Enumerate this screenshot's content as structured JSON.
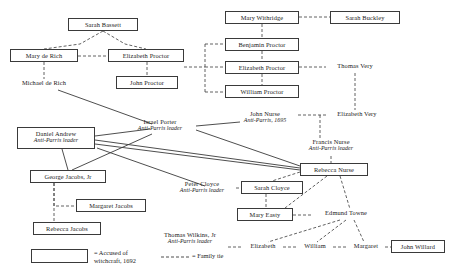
{
  "diagram": {
    "colors": {
      "line": "#3a3a3a",
      "box_border": "#3a3a3a",
      "text": "#1a1a1a",
      "background": "#ffffff"
    },
    "legend": {
      "accused_label": "= Accused of\nwitchcraft, 1692",
      "family_tie_label": "= Family tie"
    },
    "nodes": [
      {
        "id": "sarah-bassett",
        "name": "Sarah Bassett",
        "sub": "",
        "boxed": true,
        "x": 68,
        "y": 18,
        "w": 70,
        "h": 13
      },
      {
        "id": "mary-de-rich",
        "name": "Mary de Rich",
        "sub": "",
        "boxed": true,
        "x": 10,
        "y": 49,
        "w": 68,
        "h": 13
      },
      {
        "id": "elizabeth-proctor-l",
        "name": "Elizabeth Proctor",
        "sub": "",
        "boxed": true,
        "x": 108,
        "y": 49,
        "w": 76,
        "h": 13
      },
      {
        "id": "michael-de-rich",
        "name": "Michael de Rich",
        "sub": "",
        "boxed": false,
        "x": 10,
        "y": 79,
        "w": 68,
        "h": 11
      },
      {
        "id": "john-proctor",
        "name": "John Proctor",
        "sub": "",
        "boxed": true,
        "x": 116,
        "y": 76,
        "w": 62,
        "h": 13
      },
      {
        "id": "mary-withridge",
        "name": "Mary Withridge",
        "sub": "",
        "boxed": true,
        "x": 225,
        "y": 11,
        "w": 74,
        "h": 13
      },
      {
        "id": "sarah-buckley",
        "name": "Sarah Buckley",
        "sub": "",
        "boxed": true,
        "x": 330,
        "y": 11,
        "w": 70,
        "h": 13
      },
      {
        "id": "benjamin-proctor",
        "name": "Benjamin Proctor",
        "sub": "",
        "boxed": true,
        "x": 225,
        "y": 38,
        "w": 74,
        "h": 13
      },
      {
        "id": "elizabeth-proctor-r",
        "name": "Elizabeth Proctor",
        "sub": "",
        "boxed": true,
        "x": 225,
        "y": 61,
        "w": 74,
        "h": 13
      },
      {
        "id": "william-proctor",
        "name": "William Proctor",
        "sub": "",
        "boxed": true,
        "x": 225,
        "y": 85,
        "w": 74,
        "h": 13
      },
      {
        "id": "thomas-very",
        "name": "Thomas Very",
        "sub": "",
        "boxed": false,
        "x": 326,
        "y": 62,
        "w": 58,
        "h": 11
      },
      {
        "id": "john-nurse",
        "name": "John Nurse",
        "sub": "Anti-Parris, 1695",
        "boxed": false,
        "x": 232,
        "y": 110,
        "w": 66,
        "h": 18
      },
      {
        "id": "elizabeth-very",
        "name": "Elizabeth Very",
        "sub": "",
        "boxed": false,
        "x": 326,
        "y": 110,
        "w": 62,
        "h": 11
      },
      {
        "id": "israel-porter",
        "name": "Israel Porter",
        "sub": "Anti-Parris leader",
        "boxed": false,
        "x": 124,
        "y": 118,
        "w": 72,
        "h": 18
      },
      {
        "id": "daniel-andrew",
        "name": "Daniel Andrew",
        "sub": "Anti-Parris leader",
        "boxed": true,
        "x": 17,
        "y": 127,
        "w": 78,
        "h": 22
      },
      {
        "id": "francis-nurse",
        "name": "Francis Nurse",
        "sub": "Anti-Parris leader",
        "boxed": false,
        "x": 295,
        "y": 138,
        "w": 72,
        "h": 18
      },
      {
        "id": "rebecca-nurse",
        "name": "Rebecca Nurse",
        "sub": "",
        "boxed": true,
        "x": 300,
        "y": 163,
        "w": 68,
        "h": 13
      },
      {
        "id": "george-jacobs-jr",
        "name": "George Jacobs, Jr",
        "sub": "",
        "boxed": true,
        "x": 30,
        "y": 170,
        "w": 76,
        "h": 13
      },
      {
        "id": "peter-cloyce",
        "name": "Peter Cloyce",
        "sub": "Anti-Parris leader",
        "boxed": false,
        "x": 168,
        "y": 180,
        "w": 68,
        "h": 18
      },
      {
        "id": "sarah-cloyce",
        "name": "Sarah Cloyce",
        "sub": "",
        "boxed": true,
        "x": 241,
        "y": 181,
        "w": 62,
        "h": 13
      },
      {
        "id": "margaret-jacobs",
        "name": "Margaret Jacobs",
        "sub": "",
        "boxed": true,
        "x": 76,
        "y": 199,
        "w": 70,
        "h": 13
      },
      {
        "id": "mary-easty",
        "name": "Mary Easty",
        "sub": "",
        "boxed": true,
        "x": 237,
        "y": 208,
        "w": 56,
        "h": 13
      },
      {
        "id": "edmund-towne",
        "name": "Edmund Towne",
        "sub": "",
        "boxed": false,
        "x": 313,
        "y": 209,
        "w": 66,
        "h": 11
      },
      {
        "id": "rebecca-jacobs",
        "name": "Rebecca Jacobs",
        "sub": "",
        "boxed": true,
        "x": 33,
        "y": 222,
        "w": 68,
        "h": 13
      },
      {
        "id": "thomas-wilkins-jr",
        "name": "Thomas Wilkins, Jr",
        "sub": "Anti-Parris leader",
        "boxed": false,
        "x": 152,
        "y": 231,
        "w": 76,
        "h": 18
      },
      {
        "id": "elizabeth-towne",
        "name": "Elizabeth",
        "sub": "",
        "boxed": false,
        "x": 243,
        "y": 242,
        "w": 40,
        "h": 11
      },
      {
        "id": "william-towne",
        "name": "William",
        "sub": "",
        "boxed": false,
        "x": 297,
        "y": 242,
        "w": 36,
        "h": 11
      },
      {
        "id": "margaret-towne",
        "name": "Margaret",
        "sub": "",
        "boxed": false,
        "x": 347,
        "y": 242,
        "w": 38,
        "h": 11
      },
      {
        "id": "john-willard",
        "name": "John Willard",
        "sub": "",
        "boxed": true,
        "x": 391,
        "y": 240,
        "w": 54,
        "h": 13
      }
    ],
    "edges": [
      {
        "from": "sarah-bassett",
        "to": "mary-de-rich",
        "style": "dashed",
        "kind": "family-tie"
      },
      {
        "from": "sarah-bassett",
        "to": "elizabeth-proctor-l",
        "style": "dashed",
        "kind": "family-tie"
      },
      {
        "from": "mary-de-rich",
        "to": "elizabeth-proctor-l",
        "style": "dashed",
        "kind": "family-tie"
      },
      {
        "from": "mary-de-rich",
        "to": "michael-de-rich",
        "style": "dashed",
        "kind": "family-tie"
      },
      {
        "from": "elizabeth-proctor-l",
        "to": "john-proctor",
        "style": "dashed",
        "kind": "family-tie"
      },
      {
        "from": "elizabeth-proctor-l",
        "to": "proctor-bus",
        "style": "dashed",
        "kind": "family-tie"
      },
      {
        "from": "proctor-bus",
        "to": "benjamin-proctor",
        "style": "dashed",
        "kind": "family-tie"
      },
      {
        "from": "proctor-bus",
        "to": "elizabeth-proctor-r",
        "style": "dashed",
        "kind": "family-tie"
      },
      {
        "from": "proctor-bus",
        "to": "william-proctor",
        "style": "dashed",
        "kind": "family-tie"
      },
      {
        "from": "mary-withridge",
        "to": "sarah-buckley",
        "style": "dashed",
        "kind": "family-tie"
      },
      {
        "from": "mary-withridge",
        "to": "benjamin-proctor",
        "style": "dashed",
        "kind": "family-tie"
      },
      {
        "from": "benjamin-proctor",
        "to": "elizabeth-proctor-r",
        "style": "dashed",
        "kind": "family-tie"
      },
      {
        "from": "elizabeth-proctor-r",
        "to": "william-proctor",
        "style": "dashed",
        "kind": "family-tie"
      },
      {
        "from": "elizabeth-proctor-r",
        "to": "thomas-very",
        "style": "dashed",
        "kind": "family-tie"
      },
      {
        "from": "thomas-very",
        "to": "elizabeth-very",
        "style": "dashed",
        "kind": "family-tie"
      },
      {
        "from": "john-nurse",
        "to": "elizabeth-very",
        "style": "dashed",
        "kind": "family-tie"
      },
      {
        "from": "john-nurse",
        "to": "francis-nurse",
        "style": "dashed",
        "kind": "family-tie"
      },
      {
        "from": "francis-nurse",
        "to": "rebecca-nurse",
        "style": "dashed",
        "kind": "family-tie"
      },
      {
        "from": "michael-de-rich",
        "to": "israel-porter",
        "style": "solid",
        "kind": "faction-tie"
      },
      {
        "from": "daniel-andrew",
        "to": "israel-porter",
        "style": "solid",
        "kind": "faction-tie"
      },
      {
        "from": "daniel-andrew",
        "to": "rebecca-nurse",
        "style": "solid",
        "kind": "faction-tie"
      },
      {
        "from": "daniel-andrew",
        "to": "george-jacobs-jr",
        "style": "solid",
        "kind": "faction-tie"
      },
      {
        "from": "daniel-andrew",
        "to": "peter-cloyce",
        "style": "solid",
        "kind": "faction-tie"
      },
      {
        "from": "israel-porter",
        "to": "george-jacobs-jr",
        "style": "solid",
        "kind": "faction-tie"
      },
      {
        "from": "israel-porter",
        "to": "rebecca-nurse",
        "style": "solid",
        "kind": "faction-tie"
      },
      {
        "from": "israel-porter",
        "to": "thomas-wilkins-jr",
        "style": "solid",
        "kind": "faction-tie"
      },
      {
        "from": "george-jacobs-jr",
        "to": "margaret-jacobs",
        "style": "dashed",
        "kind": "family-tie"
      },
      {
        "from": "george-jacobs-jr",
        "to": "rebecca-jacobs",
        "style": "dashed",
        "kind": "family-tie"
      },
      {
        "from": "peter-cloyce",
        "to": "sarah-cloyce",
        "style": "dashed",
        "kind": "family-tie"
      },
      {
        "from": "rebecca-nurse",
        "to": "sarah-cloyce",
        "style": "dashed",
        "kind": "family-tie"
      },
      {
        "from": "rebecca-nurse",
        "to": "mary-easty",
        "style": "dashed",
        "kind": "family-tie"
      },
      {
        "from": "rebecca-nurse",
        "to": "edmund-towne",
        "style": "dashed",
        "kind": "family-tie"
      },
      {
        "from": "sarah-cloyce",
        "to": "mary-easty",
        "style": "dashed",
        "kind": "family-tie"
      },
      {
        "from": "mary-easty",
        "to": "edmund-towne",
        "style": "dashed",
        "kind": "family-tie"
      },
      {
        "from": "edmund-towne",
        "to": "elizabeth-towne",
        "style": "dashed",
        "kind": "family-tie"
      },
      {
        "from": "edmund-towne",
        "to": "william-towne",
        "style": "dashed",
        "kind": "family-tie"
      },
      {
        "from": "edmund-towne",
        "to": "margaret-towne",
        "style": "dashed",
        "kind": "family-tie"
      },
      {
        "from": "thomas-wilkins-jr",
        "to": "elizabeth-towne",
        "style": "dashed",
        "kind": "family-tie"
      },
      {
        "from": "elizabeth-towne",
        "to": "william-towne",
        "style": "dashed",
        "kind": "family-tie"
      },
      {
        "from": "william-towne",
        "to": "margaret-towne",
        "style": "dashed",
        "kind": "family-tie"
      },
      {
        "from": "margaret-towne",
        "to": "john-willard",
        "style": "dashed",
        "kind": "family-tie"
      }
    ]
  }
}
